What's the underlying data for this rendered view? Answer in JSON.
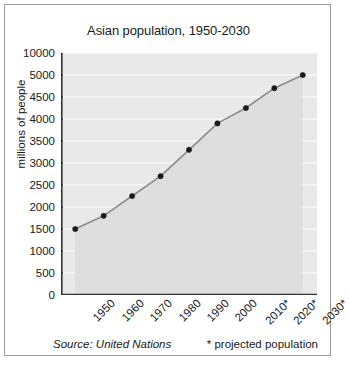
{
  "chart_data": {
    "type": "line",
    "title": "Asian population, 1950-2030",
    "xlabel": "",
    "ylabel": "millions of people",
    "categories": [
      "1950",
      "1960",
      "1970",
      "1980",
      "1990",
      "2000",
      "2010*",
      "2020*",
      "2030*"
    ],
    "values": [
      1500,
      1800,
      2250,
      2700,
      3300,
      3900,
      4250,
      4700,
      5000
    ],
    "y_tick_labels": [
      "10000",
      "5000",
      "4500",
      "4000",
      "3500",
      "3000",
      "2500",
      "2000",
      "1500",
      "1000",
      "500",
      "0"
    ],
    "y_axis_note": "irregular axis: evenly spaced ticks, 500 steps from 0 to 5000 then a compressed jump to 10000",
    "ylim": [
      0,
      10000
    ],
    "grid": true,
    "legend": "none",
    "series": [
      {
        "name": "Asian population",
        "values": [
          1500,
          1800,
          2250,
          2700,
          3300,
          3900,
          4250,
          4700,
          5000
        ]
      }
    ],
    "annotations": {
      "source": "Source: United Nations",
      "projection_note": "* projected population"
    },
    "colors": {
      "plot_background": "#e9e9e9",
      "gridline": "#ffffff",
      "line": "#8c8c8c",
      "marker": "#1a1a1a",
      "axis": "#333333",
      "frame": "#9a9a9a",
      "text": "#1a1a1a"
    }
  }
}
